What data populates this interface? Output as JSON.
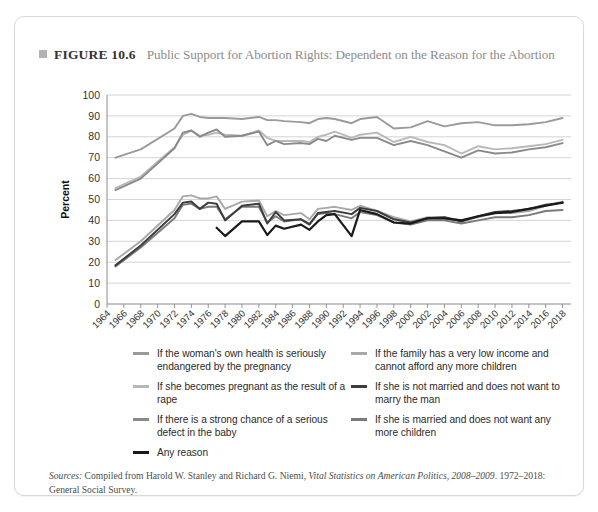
{
  "figure": {
    "marker_icon": "square-bullet-icon",
    "label": "FIGURE 10.6",
    "title": "Public Support for Abortion Rights: Dependent on the Reason for the Abortion"
  },
  "source": {
    "prefix": "Sources:",
    "body_1": " Compiled from Harold W. Stanley and Richard G. Niemi, ",
    "italic_work": "Vital Statistics on American Politics, 2008–2009",
    "body_2": ". 1972–2018: General Social Survey."
  },
  "legend": {
    "left": [
      {
        "label": "If the woman's own health is seriously endangered by the pregnancy",
        "color": "#9a9a9a",
        "width": 2.4
      },
      {
        "label": "If she becomes pregnant as the result of a rape",
        "color": "#b8b8b8",
        "width": 2.4
      },
      {
        "label": "If there is a strong chance of a serious defect in the baby",
        "color": "#8a8a8a",
        "width": 2.4
      },
      {
        "label": "Any reason",
        "color": "#1a1a1a",
        "width": 2.6
      }
    ],
    "right": [
      {
        "label": "If the family has a very low income and cannot afford any more children",
        "color": "#a8a8a8",
        "width": 2.4
      },
      {
        "label": "If she is not married and does not want to marry the man",
        "color": "#3d3d3d",
        "width": 2.6
      },
      {
        "label": "If she is married and does not want any more children",
        "color": "#7a7a7a",
        "width": 2.4
      }
    ]
  },
  "chart_data": {
    "type": "line",
    "title": "Public Support for Abortion Rights: Dependent on the Reason for the Abortion",
    "xlabel": "",
    "ylabel": "Percent",
    "ylim": [
      0,
      100
    ],
    "ytick_step": 10,
    "yticks": [
      100,
      90,
      80,
      70,
      60,
      50,
      40,
      30,
      20,
      10,
      0
    ],
    "grid": true,
    "legend_position": "below",
    "xlim": [
      1964,
      2019
    ],
    "categories": [
      1964,
      1966,
      1968,
      1970,
      1972,
      1974,
      1976,
      1978,
      1980,
      1982,
      1984,
      1986,
      1988,
      1990,
      1992,
      1994,
      1996,
      1998,
      2000,
      2002,
      2004,
      2006,
      2008,
      2010,
      2012,
      2014,
      2016,
      2018
    ],
    "xticks": [
      "1964",
      "1966",
      "1968",
      "1970",
      "1972",
      "1974",
      "1976",
      "1978",
      "1980",
      "1982",
      "1984",
      "1986",
      "1988",
      "1990",
      "1992",
      "1994",
      "1996",
      "1998",
      "2000",
      "2002",
      "2004",
      "2006",
      "2008",
      "2010",
      "2012",
      "2014",
      "2016",
      "2018"
    ],
    "series": [
      {
        "name": "If the woman's own health is seriously endangered by the pregnancy",
        "color": "#9a9a9a",
        "width": 1.9,
        "x": [
          1965,
          1968,
          1972,
          1973,
          1974,
          1975,
          1976,
          1977,
          1978,
          1980,
          1982,
          1983,
          1984,
          1985,
          1987,
          1988,
          1989,
          1990,
          1991,
          1993,
          1994,
          1996,
          1998,
          2000,
          2002,
          2004,
          2006,
          2008,
          2010,
          2012,
          2014,
          2016,
          2018
        ],
        "y": [
          70.0,
          74.0,
          84.0,
          90.0,
          91.0,
          89.5,
          89.0,
          89.0,
          89.0,
          88.5,
          89.5,
          88.0,
          88.0,
          87.5,
          87.0,
          86.5,
          88.5,
          89.0,
          88.5,
          86.5,
          88.5,
          89.5,
          84.0,
          84.5,
          87.5,
          85.0,
          86.5,
          87.0,
          85.5,
          85.5,
          86.0,
          87.0,
          89.0
        ]
      },
      {
        "name": "If there is a strong chance of a serious defect in the baby",
        "color": "#8a8a8a",
        "width": 1.9,
        "x": [
          1965,
          1968,
          1972,
          1973,
          1974,
          1975,
          1976,
          1977,
          1978,
          1980,
          1982,
          1983,
          1984,
          1985,
          1987,
          1988,
          1989,
          1990,
          1991,
          1993,
          1994,
          1996,
          1998,
          2000,
          2002,
          2004,
          2006,
          2008,
          2010,
          2012,
          2014,
          2016,
          2018
        ],
        "y": [
          54.5,
          60.0,
          74.5,
          82.0,
          83.0,
          80.0,
          82.0,
          83.5,
          80.0,
          80.5,
          82.5,
          76.0,
          78.0,
          76.5,
          77.0,
          76.5,
          79.0,
          78.0,
          80.5,
          78.5,
          79.5,
          79.5,
          76.0,
          78.0,
          76.0,
          73.0,
          70.0,
          73.5,
          72.0,
          72.5,
          74.0,
          75.0,
          77.0
        ]
      },
      {
        "name": "If she becomes pregnant as the result of a rape",
        "color": "#b8b8b8",
        "width": 1.9,
        "x": [
          1965,
          1968,
          1972,
          1973,
          1974,
          1975,
          1976,
          1977,
          1978,
          1980,
          1982,
          1983,
          1984,
          1985,
          1987,
          1988,
          1989,
          1990,
          1991,
          1993,
          1994,
          1996,
          1998,
          2000,
          2002,
          2004,
          2006,
          2008,
          2010,
          2012,
          2014,
          2016,
          2018
        ],
        "y": [
          55.5,
          61.0,
          75.0,
          81.0,
          83.0,
          80.5,
          81.0,
          82.0,
          81.0,
          80.5,
          83.0,
          79.5,
          78.0,
          78.0,
          78.0,
          77.5,
          80.0,
          81.0,
          82.5,
          79.5,
          81.0,
          82.0,
          77.5,
          80.0,
          77.5,
          76.0,
          72.0,
          75.5,
          74.0,
          74.5,
          75.5,
          76.5,
          78.5
        ]
      },
      {
        "name": "If the family has a very low income and cannot afford any more children",
        "color": "#a8a8a8",
        "width": 1.9,
        "x": [
          1965,
          1968,
          1972,
          1973,
          1974,
          1975,
          1976,
          1977,
          1978,
          1980,
          1982,
          1983,
          1984,
          1985,
          1987,
          1988,
          1989,
          1990,
          1991,
          1993,
          1994,
          1996,
          1998,
          2000,
          2002,
          2004,
          2006,
          2008,
          2010,
          2012,
          2014,
          2016,
          2018
        ],
        "y": [
          21.0,
          30.0,
          45.0,
          51.5,
          52.0,
          50.5,
          50.5,
          51.5,
          45.5,
          49.0,
          49.5,
          42.0,
          44.5,
          42.5,
          43.5,
          40.5,
          45.5,
          46.0,
          46.5,
          45.0,
          47.0,
          44.5,
          41.5,
          39.5,
          41.5,
          41.5,
          40.0,
          41.5,
          43.5,
          43.5,
          44.5,
          47.0,
          49.0
        ]
      },
      {
        "name": "If she is married and does not want any more children",
        "color": "#7a7a7a",
        "width": 1.9,
        "x": [
          1965,
          1968,
          1972,
          1973,
          1974,
          1975,
          1976,
          1977,
          1978,
          1980,
          1982,
          1983,
          1984,
          1985,
          1987,
          1988,
          1989,
          1990,
          1991,
          1993,
          1994,
          1996,
          1998,
          2000,
          2002,
          2004,
          2006,
          2008,
          2010,
          2012,
          2014,
          2016,
          2018
        ],
        "y": [
          18.0,
          27.0,
          41.0,
          47.5,
          48.0,
          45.5,
          46.5,
          46.5,
          40.5,
          46.5,
          46.5,
          39.0,
          42.0,
          39.5,
          40.5,
          38.5,
          43.0,
          43.5,
          43.0,
          41.0,
          44.0,
          42.5,
          39.0,
          38.0,
          40.0,
          40.0,
          38.5,
          40.0,
          41.5,
          41.5,
          42.5,
          44.5,
          45.0
        ]
      },
      {
        "name": "If she is not married and does not want to marry the man",
        "color": "#3d3d3d",
        "width": 2.0,
        "x": [
          1965,
          1968,
          1972,
          1973,
          1974,
          1975,
          1976,
          1977,
          1978,
          1980,
          1982,
          1983,
          1984,
          1985,
          1987,
          1988,
          1989,
          1990,
          1991,
          1993,
          1994,
          1996,
          1998,
          2000,
          2002,
          2004,
          2006,
          2008,
          2010,
          2012,
          2014,
          2016,
          2018
        ],
        "y": [
          18.5,
          28.0,
          43.0,
          48.5,
          49.0,
          45.5,
          48.5,
          48.0,
          40.0,
          47.0,
          48.0,
          38.5,
          44.0,
          40.0,
          40.5,
          38.0,
          43.5,
          44.0,
          44.5,
          43.0,
          46.0,
          44.5,
          40.5,
          39.0,
          41.0,
          41.5,
          39.5,
          42.0,
          44.0,
          44.5,
          45.5,
          47.5,
          48.5
        ]
      },
      {
        "name": "Any reason",
        "color": "#1a1a1a",
        "width": 2.2,
        "x": [
          1977,
          1978,
          1980,
          1982,
          1983,
          1984,
          1985,
          1987,
          1988,
          1989,
          1990,
          1991,
          1993,
          1994,
          1996,
          1998,
          2000,
          2002,
          2004,
          2006,
          2008,
          2010,
          2012,
          2014,
          2016,
          2018
        ],
        "y": [
          36.5,
          32.5,
          39.5,
          39.5,
          33.0,
          37.5,
          36.0,
          38.0,
          35.5,
          39.5,
          42.5,
          43.0,
          32.5,
          45.0,
          43.0,
          39.0,
          38.5,
          41.0,
          41.0,
          40.0,
          42.0,
          43.5,
          44.0,
          45.5,
          47.0,
          48.5
        ]
      }
    ]
  }
}
